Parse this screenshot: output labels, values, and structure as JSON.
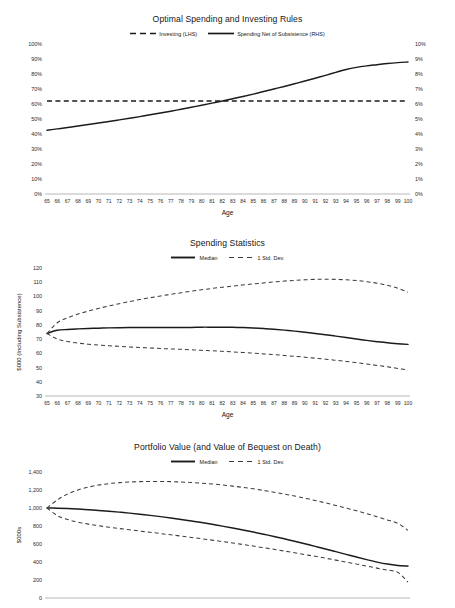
{
  "page": {
    "background": "#ffffff",
    "line_color": "#1b1b1b",
    "axis_color": "#9a9a9a"
  },
  "chart_data": [
    {
      "id": "optimal-rules",
      "type": "line",
      "title": "Optimal Spending and Investing Rules",
      "xlabel": "Age",
      "ylabel": "",
      "ylabel_right": "",
      "grid": false,
      "legend_position": "top-center",
      "x": [
        65,
        66,
        67,
        68,
        69,
        70,
        71,
        72,
        73,
        74,
        75,
        76,
        77,
        78,
        79,
        80,
        81,
        82,
        83,
        84,
        85,
        86,
        87,
        88,
        89,
        90,
        91,
        92,
        93,
        94,
        95,
        96,
        97,
        98,
        99,
        100
      ],
      "xtick_labels": [
        "65",
        "66",
        "67",
        "68",
        "69",
        "70",
        "71",
        "72",
        "73",
        "74",
        "75",
        "76",
        "77",
        "78",
        "79",
        "80",
        "81",
        "82",
        "83",
        "84",
        "85",
        "86",
        "87",
        "88",
        "89",
        "90",
        "91",
        "92",
        "93",
        "94",
        "95",
        "96",
        "97",
        "98",
        "99",
        "100"
      ],
      "ylim": [
        0,
        100
      ],
      "ytick_labels": [
        "0%",
        "10%",
        "20%",
        "30%",
        "40%",
        "50%",
        "60%",
        "70%",
        "80%",
        "90%",
        "100%"
      ],
      "ylim_right": [
        0,
        10
      ],
      "ytick_labels_right": [
        "0%",
        "1%",
        "2%",
        "3%",
        "4%",
        "5%",
        "6%",
        "7%",
        "8%",
        "9%",
        "10%"
      ],
      "series": [
        {
          "name": "Investing (LHS)",
          "style": "dashed",
          "axis": "left",
          "values": [
            62,
            62,
            62,
            62,
            62,
            62,
            62,
            62,
            62,
            62,
            62,
            62,
            62,
            62,
            62,
            62,
            62,
            62,
            62,
            62,
            62,
            62,
            62,
            62,
            62,
            62,
            62,
            62,
            62,
            62,
            62,
            62,
            62,
            62,
            62,
            62
          ]
        },
        {
          "name": "Spending Net of Subsistence (RHS)",
          "style": "solid",
          "axis": "right",
          "values": [
            4.25,
            4.34,
            4.43,
            4.53,
            4.63,
            4.73,
            4.83,
            4.94,
            5.05,
            5.16,
            5.28,
            5.4,
            5.52,
            5.65,
            5.78,
            5.92,
            6.06,
            6.2,
            6.35,
            6.5,
            6.66,
            6.83,
            7.0,
            7.17,
            7.35,
            7.53,
            7.72,
            7.91,
            8.11,
            8.3,
            8.44,
            8.54,
            8.62,
            8.7,
            8.76,
            8.8
          ]
        }
      ]
    },
    {
      "id": "spending-statistics",
      "type": "line",
      "title": "Spending Statistics",
      "xlabel": "Age",
      "ylabel": "$000 (Including Subsistence)",
      "grid": false,
      "legend_position": "top-center",
      "x": [
        65,
        66,
        67,
        68,
        69,
        70,
        71,
        72,
        73,
        74,
        75,
        76,
        77,
        78,
        79,
        80,
        81,
        82,
        83,
        84,
        85,
        86,
        87,
        88,
        89,
        90,
        91,
        92,
        93,
        94,
        95,
        96,
        97,
        98,
        99,
        100
      ],
      "xtick_labels": [
        "65",
        "66",
        "67",
        "68",
        "69",
        "70",
        "71",
        "72",
        "73",
        "74",
        "75",
        "76",
        "77",
        "78",
        "79",
        "80",
        "81",
        "82",
        "83",
        "84",
        "85",
        "86",
        "87",
        "88",
        "89",
        "90",
        "91",
        "92",
        "93",
        "94",
        "95",
        "96",
        "97",
        "98",
        "99",
        "100"
      ],
      "ylim": [
        30,
        120
      ],
      "ytick_labels": [
        "30",
        "40",
        "50",
        "60",
        "70",
        "80",
        "90",
        "100",
        "110",
        "120"
      ],
      "series": [
        {
          "name": "Median",
          "style": "solid",
          "values": [
            74.0,
            76.2,
            76.8,
            77.2,
            77.5,
            77.7,
            77.9,
            78.0,
            78.1,
            78.1,
            78.2,
            78.2,
            78.2,
            78.1,
            78.2,
            78.4,
            78.4,
            78.4,
            78.3,
            78.1,
            77.8,
            77.4,
            76.9,
            76.3,
            75.6,
            74.8,
            74.0,
            73.1,
            72.1,
            71.1,
            70.1,
            69.1,
            68.2,
            67.4,
            66.8,
            66.3
          ]
        },
        {
          "name": "1 Std. Dev.",
          "style": "dashed",
          "band": "upper",
          "values": [
            74.0,
            81.5,
            85.0,
            87.6,
            89.7,
            91.6,
            93.3,
            94.9,
            96.4,
            97.8,
            99.1,
            100.3,
            101.5,
            102.6,
            103.7,
            104.7,
            105.6,
            106.5,
            107.3,
            108.1,
            108.8,
            109.5,
            110.2,
            110.8,
            111.3,
            111.7,
            112.0,
            112.1,
            112.0,
            111.7,
            111.2,
            110.4,
            109.3,
            107.8,
            105.8,
            103.0
          ]
        },
        {
          "name": "1 Std. Dev.",
          "style": "dashed",
          "band": "lower",
          "values": [
            74.0,
            70.0,
            68.3,
            67.2,
            66.4,
            65.8,
            65.3,
            64.9,
            64.5,
            64.1,
            63.8,
            63.4,
            63.1,
            62.8,
            62.5,
            62.1,
            61.8,
            61.4,
            61.0,
            60.6,
            60.1,
            59.6,
            59.1,
            58.5,
            57.9,
            57.3,
            56.6,
            55.9,
            55.1,
            54.3,
            53.4,
            52.5,
            51.5,
            50.5,
            49.4,
            48.2
          ]
        }
      ]
    },
    {
      "id": "portfolio-value",
      "type": "line",
      "title": "Portfolio Value (and Value of Bequest on Death)",
      "xlabel": "Age",
      "ylabel": "$000s",
      "grid": false,
      "legend_position": "top-center",
      "x": [
        65,
        66,
        67,
        68,
        69,
        70,
        71,
        72,
        73,
        74,
        75,
        76,
        77,
        78,
        79,
        80,
        81,
        82,
        83,
        84,
        85,
        86,
        87,
        88,
        89,
        90,
        91,
        92,
        93,
        94,
        95,
        96,
        97,
        98,
        99,
        100
      ],
      "xtick_labels": [
        "65",
        "66",
        "67",
        "68",
        "69",
        "70",
        "71",
        "72",
        "73",
        "74",
        "75",
        "76",
        "77",
        "78",
        "79",
        "80",
        "81",
        "82",
        "83",
        "84",
        "85",
        "86",
        "87",
        "88",
        "89",
        "90",
        "91",
        "92",
        "93",
        "94",
        "95",
        "96",
        "97",
        "98",
        "99",
        "100"
      ],
      "ylim": [
        0,
        1400
      ],
      "ytick_labels": [
        "0",
        "200",
        "400",
        "600",
        "800",
        "1,000",
        "1,200",
        "1,400"
      ],
      "series": [
        {
          "name": "Median",
          "style": "solid",
          "values": [
            1000,
            998,
            994,
            988,
            981,
            973,
            964,
            954,
            943,
            931,
            918,
            904,
            889,
            873,
            856,
            838,
            819,
            799,
            778,
            756,
            733,
            709,
            684,
            658,
            631,
            603,
            574,
            545,
            515,
            485,
            455,
            426,
            399,
            377,
            362,
            355
          ]
        },
        {
          "name": "1 Std. Dev.",
          "style": "dashed",
          "band": "upper",
          "values": [
            1000,
            1090,
            1155,
            1200,
            1232,
            1255,
            1271,
            1282,
            1289,
            1293,
            1295,
            1295,
            1293,
            1289,
            1283,
            1276,
            1267,
            1256,
            1243,
            1229,
            1213,
            1195,
            1176,
            1155,
            1133,
            1109,
            1084,
            1057,
            1029,
            1000,
            969,
            937,
            903,
            868,
            830,
            752
          ]
        },
        {
          "name": "1 Std. Dev.",
          "style": "dashed",
          "band": "lower",
          "values": [
            1000,
            915,
            872,
            843,
            821,
            803,
            787,
            772,
            758,
            744,
            730,
            716,
            702,
            688,
            673,
            658,
            643,
            627,
            611,
            594,
            577,
            559,
            541,
            522,
            503,
            483,
            463,
            442,
            421,
            399,
            377,
            355,
            332,
            309,
            286,
            176
          ]
        }
      ]
    }
  ]
}
